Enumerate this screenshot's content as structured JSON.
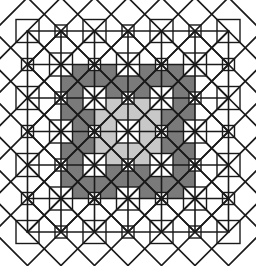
{
  "figure": {
    "type": "geometric-pattern",
    "width": 256,
    "height": 266,
    "background_color": "#ffffff"
  },
  "palette": {
    "background": "#ffffff",
    "stroke": "#1a1a1a",
    "fill_none": "#ffffff",
    "fill_light": "#c8c8c8",
    "fill_mid": "#a8a8a8",
    "fill_dark": "#7a7a7a"
  },
  "geometry": {
    "module_px": 33.5,
    "grid_cols": 6,
    "grid_rows": 6,
    "origin_x": 27.5,
    "origin_y": 31.0,
    "center_x": 128.0,
    "center_y": 131.5,
    "diamond_half_diagonal": 33.5,
    "inner_square_half_side": 11.5,
    "small_square_half_side": 6.0,
    "stroke_width_grid": 1.6,
    "stroke_width_diamond": 1.7
  },
  "shading": {
    "ring_labels": [
      "center",
      "inner",
      "outer",
      "rim"
    ],
    "ring_fills": [
      "#ffffff",
      "#c8c8c8",
      "#a8a8a8",
      "#7a7a7a"
    ],
    "note": "Fill darkness increases with radial distance from the pattern center; outermost star points are unshaded white."
  },
  "chart_data": {
    "type": "table",
    "xlabel": "",
    "ylabel": "",
    "grid": true,
    "legend": "none",
    "categories": [
      "center",
      "inner ring",
      "middle ring",
      "outer ring",
      "rim points"
    ],
    "values": [
      1,
      4,
      8,
      12,
      16
    ],
    "series": [
      {
        "name": "fill shade",
        "values": [
          "#ffffff",
          "#c8c8c8",
          "#a8a8a8",
          "#7a7a7a",
          "#ffffff"
        ]
      }
    ],
    "annotations": [
      "6 x 6 square lattice, module approx 33.5 px",
      "Rotated square (diamond) centered at every lattice node",
      "Inscribed axis-aligned squares in alternating cells",
      "Three gray tones: #c8c8c8, #a8a8a8, #7a7a7a on white"
    ]
  }
}
